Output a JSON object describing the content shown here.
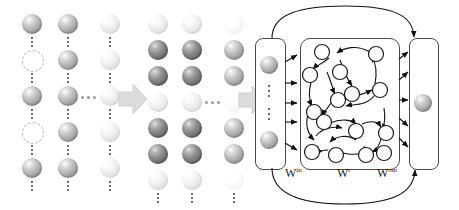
{
  "figure": {
    "labels": {
      "w_in": "W",
      "w_in_sup": "in",
      "w_res": "W",
      "w_res_sup": "r",
      "w_out": "W",
      "w_out_sup": "out"
    },
    "ellipsis_horizontal": "...",
    "colors": {
      "node_stroke": "#1c1c1c",
      "node_fill": "#ffffff",
      "panel_stroke": "#4a4a4a",
      "arrow_fill": "#d9d9d9",
      "sphere_mid": "#b9b9b9",
      "sphere_dark": "#8f8f8f",
      "sphere_light": "#ededed",
      "background": "#ffffff"
    }
  },
  "left_grid": {
    "name": "input-spike-grid",
    "columns": 3,
    "rows": 5,
    "cells": [
      [
        "mid",
        "mid",
        "light"
      ],
      [
        "hollow",
        "mid",
        "light"
      ],
      [
        "mid",
        "mid",
        "light"
      ],
      [
        "hollow",
        "mid",
        "light"
      ],
      [
        "mid",
        "mid",
        "light"
      ]
    ]
  },
  "right_grid": {
    "name": "reservoir-state-grid",
    "columns": 3,
    "rows": 7,
    "cells": [
      [
        "light",
        "light",
        "vlight"
      ],
      [
        "dark",
        "dark",
        "mid"
      ],
      [
        "dark",
        "dark",
        "mid"
      ],
      [
        "light",
        "light",
        "vlight"
      ],
      [
        "dark",
        "dark",
        "mid"
      ],
      [
        "dark",
        "dark",
        "mid"
      ],
      [
        "light",
        "light",
        "vlight"
      ]
    ]
  },
  "network": {
    "name": "reservoir-network",
    "input_layer": {
      "label": "input-layer",
      "spheres": 2,
      "ellipsis": "vertical"
    },
    "reservoir": {
      "label": "reservoir-layer",
      "nodes": 15
    },
    "output_layer": {
      "label": "output-layer",
      "spheres": 1
    },
    "feedback_arcs": 2,
    "input_connections": 5,
    "output_connections": 5
  }
}
